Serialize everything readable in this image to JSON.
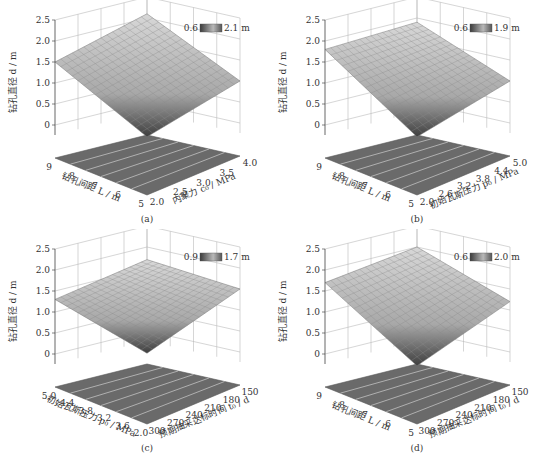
{
  "chart_data": [
    {
      "id": "a",
      "type": "surface3d",
      "caption": "(a)",
      "zlabel": "钻孔直径 d / m",
      "xlabel": "内聚力 c₀ / MPa",
      "ylabel": "钻孔间距 L / m",
      "z_ticks": [
        "0",
        "0.5",
        "1.0",
        "1.5",
        "2.0",
        "2.5"
      ],
      "x_ticks": [
        "2.0",
        "2.5",
        "3.0",
        "3.5",
        "4.0"
      ],
      "y_ticks": [
        "5",
        "6",
        "7",
        "8",
        "9"
      ],
      "legend": {
        "min": "0.6",
        "max": "2.1 m"
      },
      "corners": {
        "front": 0.6,
        "left": 1.5,
        "right": 1.0,
        "back": 2.1
      },
      "zlim": [
        0,
        2.5
      ]
    },
    {
      "id": "b",
      "type": "surface3d",
      "caption": "(b)",
      "zlabel": "钻孔直径 d / m",
      "xlabel": "初始瓦斯压力 p₀ / MPa",
      "ylabel": "钻孔间距 L / m",
      "z_ticks": [
        "0",
        "0.5",
        "1.0",
        "1.5",
        "2.0",
        "2.5"
      ],
      "x_ticks": [
        "2.0",
        "2.6",
        "3.2",
        "3.8",
        "4.4",
        "5.0"
      ],
      "y_ticks": [
        "5",
        "6",
        "7",
        "8",
        "9"
      ],
      "legend": {
        "min": "0.6",
        "max": "1.9 m"
      },
      "corners": {
        "front": 0.6,
        "left": 1.8,
        "right": 1.0,
        "back": 1.9
      },
      "zlim": [
        0,
        2.5
      ]
    },
    {
      "id": "c",
      "type": "surface3d",
      "caption": "(c)",
      "zlabel": "钻孔直径 d / m",
      "xlabel": "预期抽采达标时间 t₀ / d",
      "ylabel": "初始瓦斯压力 p₀ / MPa",
      "z_ticks": [
        "0",
        "0.5",
        "1.0",
        "1.5",
        "2.0",
        "2.5"
      ],
      "x_ticks": [
        "300",
        "270",
        "240",
        "210",
        "180",
        "150"
      ],
      "y_ticks": [
        "2.0",
        "3.6",
        "3.2",
        "3.8",
        "4.4",
        "5.0"
      ],
      "legend": {
        "min": "0.9",
        "max": "1.7 m"
      },
      "corners": {
        "front": 0.9,
        "left": 1.3,
        "right": 1.5,
        "back": 1.7
      },
      "zlim": [
        0,
        2.5
      ]
    },
    {
      "id": "d",
      "type": "surface3d",
      "caption": "(d)",
      "zlabel": "钻孔直径 d / m",
      "xlabel": "预期抽采达标时间 t₀ / d",
      "ylabel": "钻孔间距 L / m",
      "z_ticks": [
        "0",
        "0.5",
        "1.0",
        "1.5",
        "2.0",
        "2.5"
      ],
      "x_ticks": [
        "300",
        "270",
        "240",
        "210",
        "180",
        "150"
      ],
      "y_ticks": [
        "5",
        "6",
        "7",
        "8",
        "9"
      ],
      "legend": {
        "min": "0.6",
        "max": "2.0 m"
      },
      "corners": {
        "front": 0.6,
        "left": 1.7,
        "right": 1.2,
        "back": 2.0
      },
      "zlim": [
        0,
        2.5
      ]
    }
  ]
}
